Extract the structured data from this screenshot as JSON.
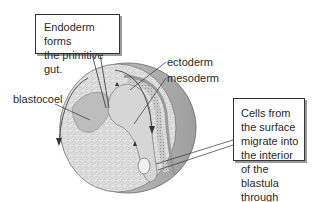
{
  "diagram": {
    "callouts": {
      "endoderm": {
        "lines": [
          "Endoderm forms",
          "the primitive gut."
        ]
      },
      "cells": {
        "lines": [
          "Cells from the surface",
          "migrate into the interior",
          "of the blastula through",
          "the blastopore."
        ]
      }
    },
    "labels": {
      "ectoderm": "ectoderm",
      "mesoderm": "mesoderm",
      "blastocoel": "blastocoel"
    },
    "colors": {
      "outer_shell": "#b9b9b9",
      "interior": "#dcdcdc",
      "cavity": "#c8c8c8",
      "lines": "#333333"
    }
  }
}
